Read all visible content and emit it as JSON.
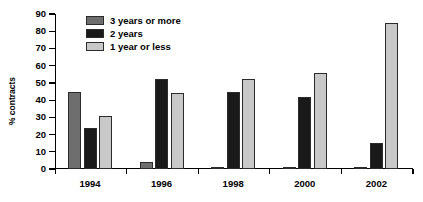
{
  "chart_data": {
    "type": "bar",
    "title": "",
    "subtitle": "",
    "xlabel": "",
    "ylabel": "% contracts",
    "categories": [
      "1994",
      "1996",
      "1998",
      "2000",
      "2002"
    ],
    "series": [
      {
        "name": "3 years or more",
        "color": "#6e6e6e",
        "values": [
          45,
          4,
          1,
          1,
          1
        ]
      },
      {
        "name": "2 years",
        "color": "#1a1a1a",
        "values": [
          24,
          52,
          45,
          42,
          15
        ]
      },
      {
        "name": "1 year or less",
        "color": "#c8c8c8",
        "values": [
          31,
          44,
          52,
          56,
          85
        ]
      }
    ],
    "ylim": [
      0,
      90
    ],
    "ytick_values": [
      0,
      10,
      20,
      30,
      40,
      50,
      60,
      70,
      80,
      90
    ],
    "ytick_labels": [
      "0",
      "10",
      "20",
      "30",
      "40",
      "50",
      "60",
      "70",
      "80",
      "90"
    ],
    "grid": false,
    "legend_position": "upper-left-inside",
    "bar_outline_color": "#2b2b2b",
    "background_color": "#ffffff",
    "axis_color": "#000000"
  }
}
